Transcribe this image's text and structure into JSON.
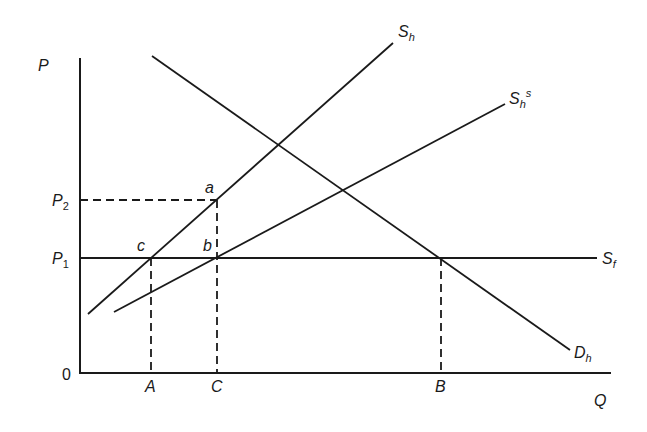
{
  "diagram": {
    "type": "supply-demand",
    "axes": {
      "y_label": "P",
      "x_label": "Q",
      "origin_label": "0"
    },
    "price_levels": [
      {
        "name": "P",
        "sub": "2"
      },
      {
        "name": "P",
        "sub": "1"
      }
    ],
    "quantity_marks": [
      "A",
      "C",
      "B"
    ],
    "curves": {
      "home_supply": {
        "name": "S",
        "sub": "h"
      },
      "subsidized_supply": {
        "name": "S",
        "sub": "h",
        "sup": "s"
      },
      "foreign_supply": {
        "name": "S",
        "sub": "f"
      },
      "home_demand": {
        "name": "D",
        "sub": "h"
      }
    },
    "points": [
      "a",
      "b",
      "c"
    ]
  },
  "colors": {
    "ink": "#1a1a1a",
    "background": "#ffffff"
  }
}
